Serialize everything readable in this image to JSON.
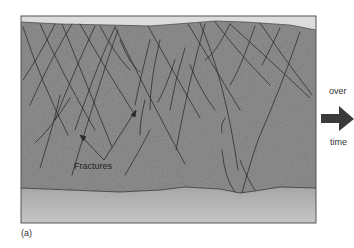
{
  "diagram": {
    "panel_label": "(a)",
    "annotation": "Fractures",
    "arrow_label_top": "over",
    "arrow_label_bottom": "time",
    "colors": {
      "background": "#ffffff",
      "top_band": "#dcdcdc",
      "rock": "#8b8b8b",
      "bedrock_top": "#a8a8a8",
      "bedrock_bottom": "#c4c4c4",
      "fracture_line": "#2a2a2a",
      "frame": "#555555",
      "arrow": "#3a3a3a"
    }
  }
}
